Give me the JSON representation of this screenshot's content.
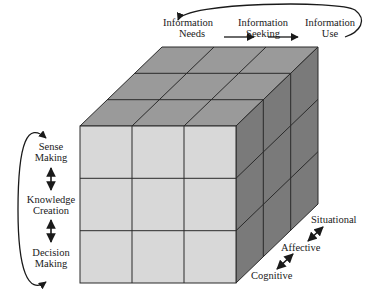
{
  "diagram": {
    "top_axis": {
      "stages": [
        {
          "line1": "Information",
          "line2": "Needs"
        },
        {
          "line1": "Information",
          "line2": "Seeking"
        },
        {
          "line1": "Information",
          "line2": "Use"
        }
      ]
    },
    "left_axis": {
      "stages": [
        {
          "line1": "Sense",
          "line2": "Making"
        },
        {
          "line1": "Knowledge",
          "line2": "Creation"
        },
        {
          "line1": "Decision",
          "line2": "Making"
        }
      ]
    },
    "depth_axis": {
      "stages": [
        "Situational",
        "Affective",
        "Cognitive"
      ]
    },
    "colors": {
      "front_face": "#d8d8d8",
      "top_face": "#9a9a9a",
      "side_face": "#7a7a7a",
      "grid_line": "#2a2a2a"
    },
    "grid": {
      "rows": 3,
      "cols": 3,
      "depth": 3
    }
  }
}
